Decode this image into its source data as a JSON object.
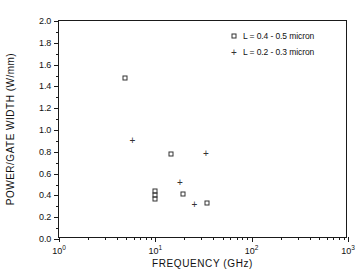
{
  "chart_data": {
    "type": "scatter",
    "title": "",
    "xlabel": "FREQUENCY (GHz)",
    "ylabel": "POWER/GATE WIDTH (W/mm)",
    "xscale": "log",
    "yscale": "linear",
    "xlim": [
      1,
      1000
    ],
    "ylim": [
      0.0,
      2.0
    ],
    "grid": false,
    "legend_position": "top-right",
    "x_tick_labels": [
      "10",
      "10",
      "10",
      "10"
    ],
    "x_tick_exponents": [
      "0",
      "1",
      "2",
      "3"
    ],
    "x_tick_values": [
      1,
      10,
      100,
      1000
    ],
    "y_tick_labels": [
      "0.0",
      "0.2",
      "0.4",
      "0.6",
      "0.8",
      "1.0",
      "1.2",
      "1.4",
      "1.6",
      "1.8",
      "2.0"
    ],
    "y_tick_values": [
      0.0,
      0.2,
      0.4,
      0.6,
      0.8,
      1.0,
      1.2,
      1.4,
      1.6,
      1.8,
      2.0
    ],
    "series": [
      {
        "name": "L = 0.4 - 0.5 micron",
        "marker": "square",
        "points": [
          {
            "x": 4.9,
            "y": 1.48
          },
          {
            "x": 14.5,
            "y": 0.78
          },
          {
            "x": 10.0,
            "y": 0.44
          },
          {
            "x": 10.0,
            "y": 0.4
          },
          {
            "x": 10.0,
            "y": 0.365
          },
          {
            "x": 19.5,
            "y": 0.41
          },
          {
            "x": 34.0,
            "y": 0.33
          }
        ]
      },
      {
        "name": "L = 0.2 - 0.3 micron",
        "marker": "plus",
        "points": [
          {
            "x": 5.8,
            "y": 0.91
          },
          {
            "x": 33.5,
            "y": 0.79
          },
          {
            "x": 18.0,
            "y": 0.525
          },
          {
            "x": 25.5,
            "y": 0.325
          }
        ]
      }
    ]
  },
  "legend": {
    "entries": [
      {
        "label": "L = 0.4 - 0.5 micron",
        "marker": "square"
      },
      {
        "label": "L = 0.2 - 0.3 micron",
        "marker": "plus"
      }
    ]
  }
}
